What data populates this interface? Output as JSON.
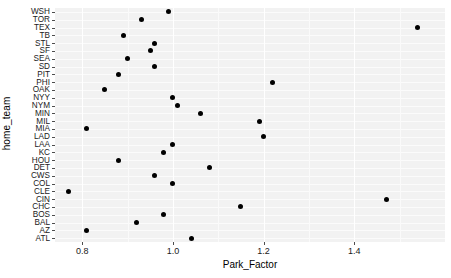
{
  "chart_data": {
    "type": "scatter",
    "title": "",
    "xlabel": "Park_Factor",
    "ylabel": "home_team",
    "xlim": [
      0.74,
      1.6
    ],
    "xticks": [
      0.8,
      1.0,
      1.2,
      1.4
    ],
    "xticklabels": [
      "0.8",
      "1.0",
      "1.2",
      "1.4"
    ],
    "grid": true,
    "legend": false,
    "reference_line": {
      "orientation": "vertical",
      "value": 1.0,
      "color": "#595959"
    },
    "categories": [
      "WSH",
      "TOR",
      "TEX",
      "TB",
      "STL",
      "SF",
      "SEA",
      "SD",
      "PIT",
      "PHI",
      "OAK",
      "NYY",
      "NYM",
      "MIN",
      "MIL",
      "MIA",
      "LAD",
      "LAA",
      "KC",
      "HOU",
      "DET",
      "CWS",
      "COL",
      "CLE",
      "CIN",
      "CHC",
      "BOS",
      "BAL",
      "AZ",
      "ATL"
    ],
    "values": [
      0.99,
      0.93,
      1.54,
      0.89,
      0.96,
      0.95,
      0.9,
      0.96,
      0.88,
      1.22,
      0.85,
      1.0,
      1.01,
      1.06,
      1.19,
      0.81,
      1.2,
      1.0,
      0.98,
      0.88,
      1.08,
      0.96,
      1.0,
      0.77,
      1.47,
      1.15,
      0.98,
      0.92,
      0.81,
      1.04
    ],
    "points": [
      {
        "team": "WSH",
        "park_factor": 0.99
      },
      {
        "team": "TOR",
        "park_factor": 0.93
      },
      {
        "team": "TEX",
        "park_factor": 1.54
      },
      {
        "team": "TB",
        "park_factor": 0.89
      },
      {
        "team": "STL",
        "park_factor": 0.96
      },
      {
        "team": "SF",
        "park_factor": 0.95
      },
      {
        "team": "SEA",
        "park_factor": 0.9
      },
      {
        "team": "SD",
        "park_factor": 0.96
      },
      {
        "team": "PIT",
        "park_factor": 0.88
      },
      {
        "team": "PHI",
        "park_factor": 1.22
      },
      {
        "team": "OAK",
        "park_factor": 0.85
      },
      {
        "team": "NYY",
        "park_factor": 1.0
      },
      {
        "team": "NYM",
        "park_factor": 1.01
      },
      {
        "team": "MIN",
        "park_factor": 1.06
      },
      {
        "team": "MIL",
        "park_factor": 1.19
      },
      {
        "team": "MIA",
        "park_factor": 0.81
      },
      {
        "team": "LAD",
        "park_factor": 1.2
      },
      {
        "team": "LAA",
        "park_factor": 1.0
      },
      {
        "team": "KC",
        "park_factor": 0.98
      },
      {
        "team": "HOU",
        "park_factor": 0.88
      },
      {
        "team": "DET",
        "park_factor": 1.08
      },
      {
        "team": "CWS",
        "park_factor": 0.96
      },
      {
        "team": "COL",
        "park_factor": 1.0
      },
      {
        "team": "CLE",
        "park_factor": 0.77
      },
      {
        "team": "CIN",
        "park_factor": 1.47
      },
      {
        "team": "CHC",
        "park_factor": 1.15
      },
      {
        "team": "BOS",
        "park_factor": 0.98
      },
      {
        "team": "BAL",
        "park_factor": 0.92
      },
      {
        "team": "AZ",
        "park_factor": 0.81
      },
      {
        "team": "ATL",
        "park_factor": 1.04
      }
    ]
  },
  "style": {
    "panel_background": "#f2f2f2",
    "gridline_color": "#ffffff",
    "point_color": "#000000",
    "reference_line_color": "#595959"
  }
}
